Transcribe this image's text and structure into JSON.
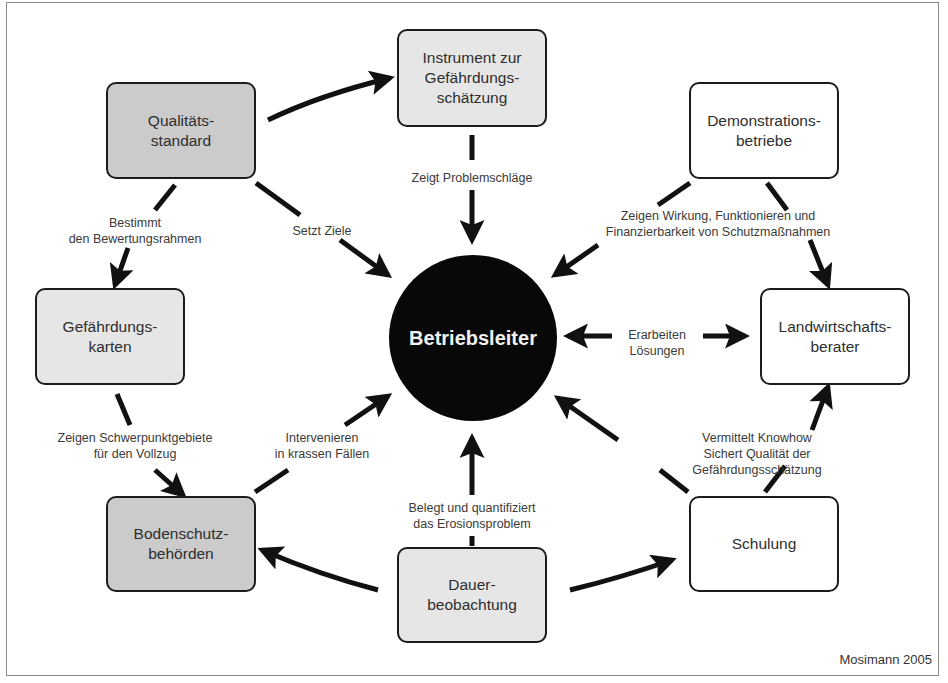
{
  "diagram": {
    "center": {
      "label": "Betriebsleiter"
    },
    "nodes": {
      "qualitaetsstandard": "Qualitäts-\nstandard",
      "instrument": "Instrument zur\nGefährdungs-\nschätzung",
      "demonstrationsbetriebe": "Demonstrations-\nbetriebe",
      "gefaehrdungskarten": "Gefährdungs-\nkarten",
      "landwirtschaftsberater": "Landwirtschafts-\nberater",
      "bodenschutzbehoerden": "Bodenschutz-\nbehörden",
      "dauerbeobachtung": "Dauer-\nbeobachtung",
      "schulung": "Schulung"
    },
    "edge_labels": {
      "bestimmt": "Bestimmt\nden Bewertungsrahmen",
      "setzt_ziele": "Setzt Ziele",
      "zeigt_problemschlaege": "Zeigt Problemschläge",
      "zeigen_wirkung": "Zeigen Wirkung, Funktionieren und\nFinanzierbarkeit von Schutzmaßnahmen",
      "erarbeiten": "Erarbeiten\nLösungen",
      "zeigen_schwerpunkt": "Zeigen Schwerpunktgebiete\nfür den Vollzug",
      "intervenieren": "Intervenieren\nin krassen Fällen",
      "belegt": "Belegt und quantifiziert\ndas Erosionsproblem",
      "vermittelt": "Vermittelt Knowhow\nSichert Qualität der Gefährdungsschätzung"
    },
    "credit": "Mosimann 2005"
  }
}
